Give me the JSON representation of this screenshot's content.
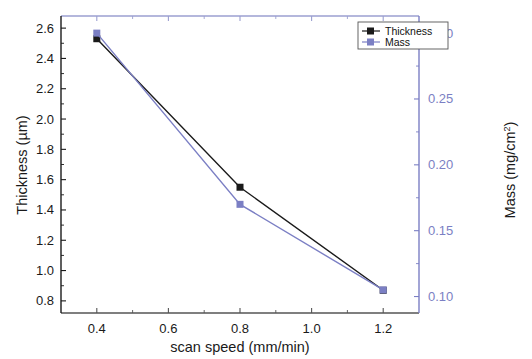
{
  "chart_data": {
    "type": "line",
    "title": "",
    "xlabel": "scan speed (mm/min)",
    "ylabel": "Thickness (µm)",
    "y2label": "Mass (mg/cm²)",
    "y2label_base": "Mass (mg/cm",
    "y2label_sup": "2",
    "y2label_close": ")",
    "x": [
      0.4,
      0.8,
      1.2
    ],
    "xlim": [
      0.3,
      1.3
    ],
    "ylim": [
      0.72,
      2.68
    ],
    "y2lim": [
      0.0875,
      0.313
    ],
    "grid": false,
    "legend_position": "top-right",
    "xticks": [
      0.4,
      0.6,
      0.8,
      1.0,
      1.2
    ],
    "xtick_labels": [
      "0.4",
      "0.6",
      "0.8",
      "1.0",
      "1.2"
    ],
    "yticks": [
      0.8,
      1.0,
      1.2,
      1.4,
      1.6,
      1.8,
      2.0,
      2.2,
      2.4,
      2.6
    ],
    "ytick_labels": [
      "0.8",
      "1.0",
      "1.2",
      "1.4",
      "1.6",
      "1.8",
      "2.0",
      "2.2",
      "2.4",
      "2.6"
    ],
    "y2ticks": [
      0.1,
      0.15,
      0.2,
      0.25,
      0.3
    ],
    "y2tick_labels": [
      "0.10",
      "0.15",
      "0.20",
      "0.25",
      "0.30"
    ],
    "series": [
      {
        "name": "Thickness",
        "axis": "left",
        "color": "#1a1a1a",
        "marker": "square",
        "values": [
          2.53,
          1.55,
          0.87
        ]
      },
      {
        "name": "Mass",
        "axis": "right",
        "color": "#7b7fc4",
        "marker": "square",
        "values": [
          0.3,
          0.17,
          0.105
        ]
      }
    ]
  },
  "legend": {
    "entries": [
      {
        "label": "Thickness",
        "color": "#1a1a1a"
      },
      {
        "label": "Mass",
        "color": "#7b7fc4"
      }
    ]
  },
  "colors": {
    "left_axis": "#1a1a1a",
    "right_axis": "#7b7fc4",
    "frame_top": "#9b9fd0",
    "frame_bottom": "#555555",
    "background": "#ffffff"
  }
}
